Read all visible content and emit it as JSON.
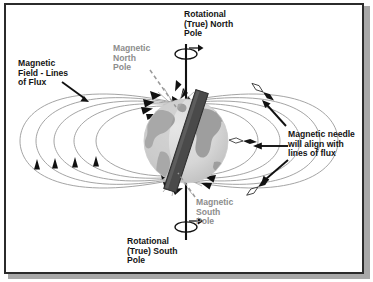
{
  "figure": {
    "width": 373,
    "height": 282,
    "background_color": "#ffffff",
    "frame_color": "#2b2b2b",
    "shadow_color": "#a8a8a8"
  },
  "labels": {
    "rotational_north": "Rotational\n(True) North\nPole",
    "magnetic_north": "Magnetic\nNorth\nPole",
    "magnetic_field": "Magnetic\nField - Lines\nof Flux",
    "magnetic_needle": "Magnetic needle\nwill align with\nlines of flux",
    "magnetic_south": "Magnetic\nSouth\nPole",
    "rotational_south": "Rotational\n(True) South\nPole"
  },
  "colors": {
    "label_black": "#141414",
    "label_grey": "#8d8d8d",
    "field_line": "#9a9a9a",
    "arrowhead": "#111111",
    "axis": "#111111",
    "globe_ocean": "#d8d8d8",
    "globe_land": "#9e9e9e",
    "globe_shade": "#c2c2c2",
    "bar_magnet": "#4a4a4a",
    "bar_magnet_edge": "#2d2d2d",
    "dashed_leader": "#9a9a9a",
    "needle_body": "#141414",
    "needle_tail": "#ffffff"
  },
  "globe": {
    "center_x": 186,
    "center_y": 141,
    "radius": 42,
    "description": "Earth sphere, light grey oceans with medium grey continents"
  },
  "bar_magnet": {
    "tilt_degrees": 18,
    "length": 104,
    "width": 13,
    "description": "Dark tilted bar magnet through the globe, north end upper-left"
  },
  "rotation_axis": {
    "x": 186,
    "top_y": 44,
    "bottom_y": 240,
    "spin_indicators": [
      {
        "position": "top",
        "cx": 186,
        "cy": 54,
        "direction": "clockwise-from-above"
      },
      {
        "position": "bottom",
        "cx": 186,
        "cy": 227,
        "direction": "clockwise-from-above"
      }
    ]
  },
  "field_lines": {
    "description": "Dipole flux loops emerging from magnetic south pole and entering magnetic north pole",
    "loop_count_per_side": 5,
    "left_arrow_count": 4,
    "north_converging_arrows": 8,
    "south_emerging_arrows": 6
  },
  "compass_needles": [
    {
      "id": "needle-upper-right",
      "x": 263,
      "y": 92,
      "angle": -52
    },
    {
      "id": "needle-middle-right",
      "x": 243,
      "y": 141,
      "angle": -86
    },
    {
      "id": "needle-lower-right",
      "x": 258,
      "y": 187,
      "angle": -126
    }
  ],
  "leader_arrows": [
    {
      "id": "flux-label-arrow",
      "from": [
        62,
        82
      ],
      "to": [
        88,
        101
      ]
    },
    {
      "id": "needle-arrow-upper",
      "from": [
        286,
        126
      ],
      "to": [
        262,
        100
      ]
    },
    {
      "id": "needle-arrow-middle",
      "from": [
        286,
        146
      ],
      "to": [
        255,
        146
      ]
    },
    {
      "id": "needle-arrow-lower",
      "from": [
        288,
        160
      ],
      "to": [
        262,
        183
      ]
    }
  ],
  "dashed_leaders": [
    {
      "id": "magnetic-north-leader",
      "from": [
        152,
        72
      ],
      "to": [
        176,
        108
      ]
    },
    {
      "id": "magnetic-south-leader",
      "from": [
        196,
        198
      ],
      "to": [
        177,
        172
      ]
    }
  ]
}
